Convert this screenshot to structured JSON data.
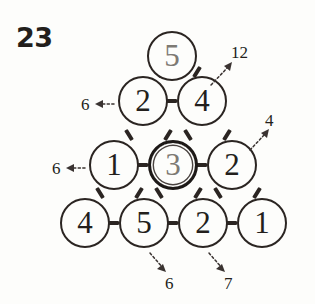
{
  "problem": {
    "number": "23"
  },
  "diagram": {
    "type": "number-pyramid",
    "rows": [
      {
        "row_index": 0,
        "cells": [
          {
            "value": "5",
            "highlighted": false,
            "muted_digit": true
          }
        ]
      },
      {
        "row_index": 1,
        "cells": [
          {
            "value": "2",
            "highlighted": false,
            "muted_digit": false
          },
          {
            "value": "4",
            "highlighted": false,
            "muted_digit": false
          }
        ]
      },
      {
        "row_index": 2,
        "cells": [
          {
            "value": "1",
            "highlighted": false,
            "muted_digit": false
          },
          {
            "value": "3",
            "highlighted": true,
            "muted_digit": true
          },
          {
            "value": "2",
            "highlighted": false,
            "muted_digit": false
          }
        ]
      },
      {
        "row_index": 3,
        "cells": [
          {
            "value": "4",
            "highlighted": false,
            "muted_digit": false
          },
          {
            "value": "5",
            "highlighted": false,
            "muted_digit": false
          },
          {
            "value": "2",
            "highlighted": false,
            "muted_digit": false
          },
          {
            "value": "1",
            "highlighted": false,
            "muted_digit": false
          }
        ]
      }
    ],
    "annotations": [
      {
        "id": "sum-up-right-top",
        "label": "12",
        "direction": "up-right"
      },
      {
        "id": "sum-left-row2",
        "label": "6",
        "direction": "left"
      },
      {
        "id": "sum-up-right-row3",
        "label": "4",
        "direction": "up-right"
      },
      {
        "id": "sum-left-row3",
        "label": "6",
        "direction": "left"
      },
      {
        "id": "sum-down-right-col2",
        "label": "6",
        "direction": "down-right"
      },
      {
        "id": "sum-down-right-col3",
        "label": "7",
        "direction": "down-right"
      }
    ]
  },
  "colors": {
    "ink": "#231f1c",
    "outline": "#2b2522",
    "muted_digit": "#7d7a74",
    "annotation": "#3a3331",
    "background": "#fdfdfb"
  }
}
